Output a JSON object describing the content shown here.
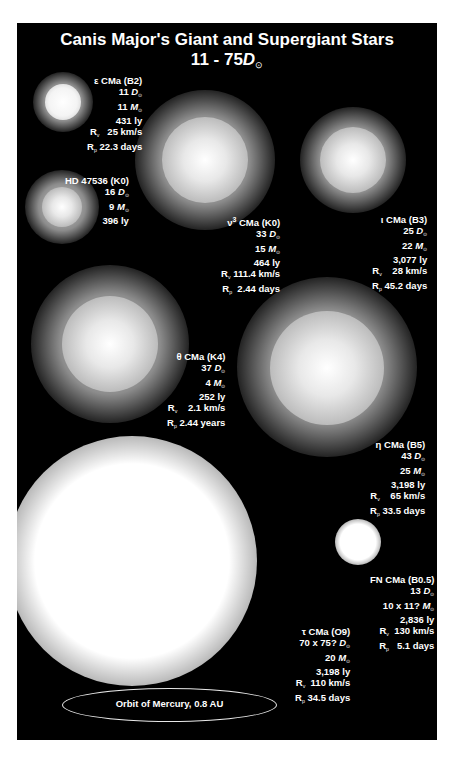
{
  "title": {
    "line1": "Canis Major's Giant and Supergiant Stars",
    "line2_prefix": "11 - 75",
    "line2_unit": "D",
    "line2_sub": "⊙"
  },
  "stars": [
    {
      "name": "ε CMa (B2)",
      "diameter": "11",
      "mass": "11",
      "distance": "431 ly",
      "rv": "25 km/s",
      "rp": "22.3 days"
    },
    {
      "name": "HD 47536 (K0)",
      "diameter": "16",
      "mass": "9",
      "distance": "396 ly"
    },
    {
      "name": "ν³ CMa (K0)",
      "name_prefix": "ν",
      "name_sup": "3",
      "name_rest": " CMa (K0)",
      "diameter": "33",
      "mass": "15",
      "distance": "464 ly",
      "rv": "111.4 km/s",
      "rp": "2.44 days"
    },
    {
      "name": "ι CMa (B3)",
      "diameter": "25",
      "mass": "22",
      "distance": "3,077 ly",
      "rv": "28 km/s",
      "rp": "45.2 days"
    },
    {
      "name": "θ CMa (K4)",
      "diameter": "37",
      "mass": "4",
      "distance": "252 ly",
      "rv": "2.1 km/s",
      "rp": "2.44 years"
    },
    {
      "name": "η CMa (B5)",
      "diameter": "43",
      "mass": "25",
      "distance": "3,198 ly",
      "rv": "65 km/s",
      "rp": "33.5 days"
    },
    {
      "name": "FN CMa (B0.5)",
      "diameter": "13",
      "mass": "10 x 11?",
      "distance": "2,836 ly",
      "rv": "130 km/s",
      "rp": "5.1 days"
    },
    {
      "name": "τ CMa (O9)",
      "diameter": "70 x 75?",
      "mass": "20",
      "distance": "3,198 ly",
      "rv": "110 km/s",
      "rp": "34.5 days"
    }
  ],
  "units": {
    "D": "D",
    "M": "M",
    "sun": "⊙",
    "Rv": "R",
    "Rv_sub": "v",
    "Rp": "R",
    "Rp_sub": "p"
  },
  "orbit": {
    "label": "Orbit of Mercury, 0.8 AU"
  }
}
